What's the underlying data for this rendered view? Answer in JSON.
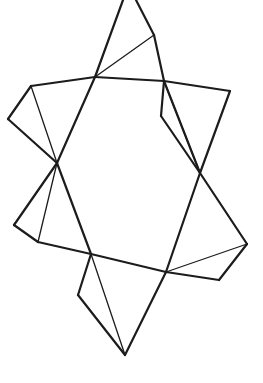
{
  "figure": {
    "stroke_color": "#1c1c1c",
    "background": "#ffffff",
    "vertices": {
      "A": [
        95,
        77
      ],
      "B": [
        164,
        81
      ],
      "C": [
        200,
        173
      ],
      "D": [
        166,
        272
      ],
      "E": [
        91,
        254
      ],
      "F": [
        57,
        163
      ],
      "topL": [
        123,
        0
      ],
      "topR": [
        136,
        0
      ],
      "topFold": [
        154,
        35
      ],
      "L1": [
        31,
        86
      ],
      "L2": [
        8,
        119
      ],
      "R1": [
        230,
        91
      ],
      "R2": [
        161,
        116
      ],
      "LL1": [
        14,
        225
      ],
      "LL2": [
        38,
        242
      ],
      "RR1": [
        247,
        244
      ],
      "RR2": [
        219,
        280
      ],
      "BOT": [
        125,
        355
      ],
      "BOTL": [
        78,
        295
      ]
    },
    "outline_edges": [
      [
        "A",
        "topL"
      ],
      [
        "topR",
        "topFold"
      ],
      [
        "topFold",
        "B"
      ],
      [
        "A",
        "B"
      ],
      [
        "B",
        "C"
      ],
      [
        "C",
        "D"
      ],
      [
        "D",
        "E"
      ],
      [
        "E",
        "F"
      ],
      [
        "F",
        "A"
      ],
      [
        "A",
        "L1"
      ],
      [
        "L1",
        "L2"
      ],
      [
        "L2",
        "F"
      ],
      [
        "B",
        "R1"
      ],
      [
        "R1",
        "C"
      ],
      [
        "B",
        "R2"
      ],
      [
        "R2",
        "C"
      ],
      [
        "F",
        "LL1"
      ],
      [
        "LL1",
        "LL2"
      ],
      [
        "LL2",
        "E"
      ],
      [
        "C",
        "RR1"
      ],
      [
        "RR1",
        "RR2"
      ],
      [
        "RR2",
        "D"
      ],
      [
        "E",
        "BOTL"
      ],
      [
        "BOTL",
        "BOT"
      ],
      [
        "BOT",
        "D"
      ]
    ],
    "fold_lines": [
      [
        "A",
        "topFold"
      ],
      [
        "L1",
        "F"
      ],
      [
        "B",
        "C"
      ],
      [
        "F",
        "LL2"
      ],
      [
        "D",
        "RR1"
      ],
      [
        "E",
        "BOT"
      ]
    ]
  }
}
